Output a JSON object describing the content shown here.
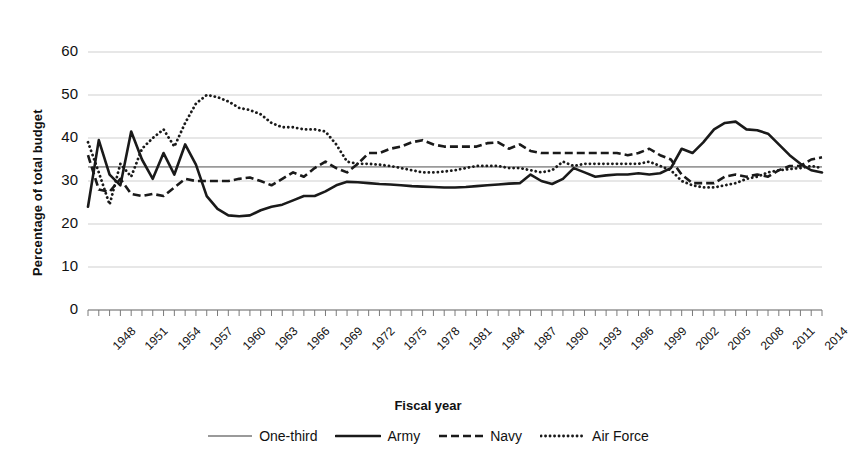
{
  "chart_data": {
    "type": "line",
    "title": "",
    "xlabel": "Fiscal year",
    "ylabel": "Percentage of total budget",
    "ylim": [
      0,
      60
    ],
    "ytick_values": [
      0,
      10,
      20,
      30,
      40,
      50,
      60
    ],
    "ytick_labels": [
      "0",
      "10",
      "20",
      "30",
      "40",
      "50",
      "60"
    ],
    "xlim": [
      1948,
      2016
    ],
    "grid": true,
    "legend_position": "bottom",
    "x": [
      1948,
      1949,
      1950,
      1951,
      1952,
      1953,
      1954,
      1955,
      1956,
      1957,
      1958,
      1959,
      1960,
      1961,
      1962,
      1963,
      1964,
      1965,
      1966,
      1967,
      1968,
      1969,
      1970,
      1971,
      1972,
      1973,
      1974,
      1975,
      1976,
      1977,
      1978,
      1979,
      1980,
      1981,
      1982,
      1983,
      1984,
      1985,
      1986,
      1987,
      1988,
      1989,
      1990,
      1991,
      1992,
      1993,
      1994,
      1995,
      1996,
      1997,
      1998,
      1999,
      2000,
      2001,
      2002,
      2003,
      2004,
      2005,
      2006,
      2007,
      2008,
      2009,
      2010,
      2011,
      2012,
      2013,
      2014,
      2015,
      2016
    ],
    "xtick_labels": [
      "1948",
      "1951",
      "1954",
      "1957",
      "1960",
      "1963",
      "1966",
      "1969",
      "1972",
      "1975",
      "1978",
      "1981",
      "1984",
      "1987",
      "1990",
      "1993",
      "1996",
      "1999",
      "2002",
      "2005",
      "2008",
      "2011",
      "2014"
    ],
    "xtick_values": [
      1948,
      1951,
      1954,
      1957,
      1960,
      1963,
      1966,
      1969,
      1972,
      1975,
      1978,
      1981,
      1984,
      1987,
      1990,
      1993,
      1996,
      1999,
      2002,
      2005,
      2008,
      2011,
      2014
    ],
    "series": [
      {
        "name": "One-third",
        "style": "solid-thin-gray",
        "color": "#9a9a9a",
        "constant": 33.3,
        "values": [
          33.3,
          33.3,
          33.3,
          33.3,
          33.3,
          33.3,
          33.3,
          33.3,
          33.3,
          33.3,
          33.3,
          33.3,
          33.3,
          33.3,
          33.3,
          33.3,
          33.3,
          33.3,
          33.3,
          33.3,
          33.3,
          33.3,
          33.3,
          33.3,
          33.3,
          33.3,
          33.3,
          33.3,
          33.3,
          33.3,
          33.3,
          33.3,
          33.3,
          33.3,
          33.3,
          33.3,
          33.3,
          33.3,
          33.3,
          33.3,
          33.3,
          33.3,
          33.3,
          33.3,
          33.3,
          33.3,
          33.3,
          33.3,
          33.3,
          33.3,
          33.3,
          33.3,
          33.3,
          33.3,
          33.3,
          33.3,
          33.3,
          33.3,
          33.3,
          33.3,
          33.3,
          33.3,
          33.3,
          33.3,
          33.3,
          33.3,
          33.3,
          33.3,
          33.3
        ]
      },
      {
        "name": "Army",
        "style": "solid-thick-black",
        "color": "#1a1a1a",
        "values": [
          24.0,
          39.5,
          31.5,
          29.0,
          41.5,
          35.0,
          30.5,
          36.5,
          31.5,
          38.5,
          33.8,
          26.5,
          23.5,
          22.0,
          21.8,
          22.0,
          23.2,
          24.0,
          24.5,
          25.5,
          26.5,
          26.5,
          27.6,
          29.0,
          29.8,
          29.7,
          29.5,
          29.3,
          29.2,
          29.0,
          28.8,
          28.7,
          28.6,
          28.5,
          28.5,
          28.6,
          28.8,
          29.0,
          29.2,
          29.4,
          29.5,
          31.5,
          30.0,
          29.3,
          30.5,
          33.0,
          32.0,
          31.0,
          31.3,
          31.5,
          31.5,
          31.8,
          31.5,
          31.8,
          33.0,
          37.5,
          36.5,
          39.0,
          42.0,
          43.5,
          43.8,
          42.0,
          41.8,
          41.0,
          38.5,
          36.0,
          34.0,
          32.5,
          32.0
        ]
      },
      {
        "name": "Navy",
        "style": "dashed-black",
        "color": "#1a1a1a",
        "values": [
          36.0,
          28.0,
          27.5,
          30.5,
          27.0,
          26.5,
          27.0,
          26.5,
          28.5,
          30.5,
          30.0,
          30.0,
          30.0,
          30.0,
          30.5,
          30.8,
          30.0,
          29.0,
          30.5,
          32.0,
          31.0,
          33.0,
          34.5,
          33.0,
          32.0,
          34.0,
          36.5,
          36.5,
          37.5,
          38.0,
          39.0,
          39.5,
          38.5,
          38.0,
          38.0,
          38.0,
          38.0,
          38.8,
          39.0,
          37.5,
          38.5,
          37.0,
          36.5,
          36.5,
          36.5,
          36.5,
          36.5,
          36.5,
          36.5,
          36.5,
          36.0,
          36.5,
          37.5,
          36.0,
          35.0,
          31.5,
          29.5,
          29.5,
          29.5,
          31.0,
          31.5,
          31.0,
          31.5,
          31.0,
          32.5,
          33.5,
          33.5,
          35.0,
          35.5
        ]
      },
      {
        "name": "Air Force",
        "style": "dotted-black",
        "color": "#1a1a1a",
        "values": [
          39.0,
          32.0,
          24.5,
          34.0,
          31.0,
          37.5,
          40.0,
          42.0,
          38.0,
          43.5,
          48.0,
          50.0,
          49.5,
          48.5,
          47.0,
          46.5,
          45.5,
          43.5,
          42.5,
          42.5,
          42.0,
          42.0,
          41.5,
          38.5,
          34.5,
          34.0,
          34.0,
          33.8,
          33.5,
          33.0,
          32.5,
          32.0,
          32.0,
          32.2,
          32.5,
          33.0,
          33.5,
          33.5,
          33.5,
          33.0,
          33.0,
          32.5,
          32.0,
          32.5,
          34.5,
          33.5,
          34.0,
          34.0,
          34.0,
          34.0,
          34.0,
          34.0,
          34.5,
          33.5,
          32.5,
          30.0,
          29.0,
          28.5,
          28.5,
          29.0,
          29.5,
          30.5,
          31.0,
          32.0,
          32.5,
          32.8,
          33.0,
          33.5,
          33.0
        ]
      }
    ]
  },
  "axes": {
    "ylabel": "Percentage of total budget",
    "xlabel": "Fiscal year"
  },
  "legend": {
    "items": [
      {
        "label": "One-third",
        "swatch": "solid-thin-gray"
      },
      {
        "label": "Army",
        "swatch": "solid-thick-black"
      },
      {
        "label": "Navy",
        "swatch": "dashed-black"
      },
      {
        "label": "Air Force",
        "swatch": "dotted-black"
      }
    ]
  }
}
